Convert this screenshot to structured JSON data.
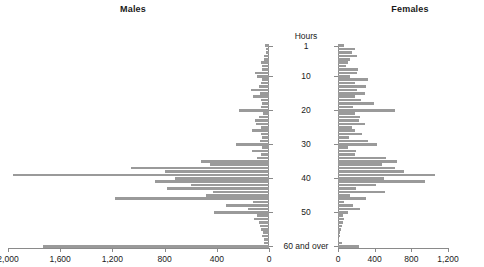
{
  "panels": {
    "males_title": "Males",
    "females_title": "Females",
    "center_heading": "Hours"
  },
  "colors": {
    "bar": "#9a9a9a",
    "axis": "#8a8a8a",
    "text": "#1a1a1a",
    "background": "#ffffff"
  },
  "chart_data": {
    "type": "bar",
    "orientation": "horizontal",
    "layout": "population-pyramid",
    "title": "",
    "subtitle": "",
    "xlabel": "",
    "ylabel": "Hours",
    "grid": false,
    "legend_position": "none",
    "categories": [
      "1",
      "2",
      "3",
      "4",
      "5",
      "6",
      "7",
      "8",
      "9",
      "10",
      "11",
      "12",
      "13",
      "14",
      "15",
      "16",
      "17",
      "18",
      "19",
      "20",
      "21",
      "22",
      "23",
      "24",
      "25",
      "26",
      "27",
      "28",
      "29",
      "30",
      "31",
      "32",
      "33",
      "34",
      "35",
      "36",
      "37",
      "38",
      "39",
      "40",
      "41",
      "42",
      "43",
      "44",
      "45",
      "46",
      "47",
      "48",
      "49",
      "50",
      "51",
      "52",
      "53",
      "54",
      "55",
      "56",
      "57",
      "58",
      "59",
      "60 and over"
    ],
    "ytick_labels": [
      "1",
      "10",
      "20",
      "30",
      "40",
      "50",
      "60 and over"
    ],
    "ytick_categories": [
      1,
      10,
      20,
      30,
      40,
      50,
      60
    ],
    "panels": [
      {
        "name": "Males",
        "side": "left",
        "xlim": [
          0,
          2000
        ],
        "xticks": [
          0,
          400,
          800,
          1200,
          1600,
          2000
        ],
        "xtick_labels": [
          "0",
          "400",
          "800",
          "1,200",
          "1,600",
          "2,000"
        ],
        "values": [
          30,
          20,
          25,
          40,
          35,
          60,
          55,
          50,
          110,
          95,
          50,
          60,
          80,
          135,
          70,
          120,
          65,
          55,
          60,
          230,
          45,
          75,
          110,
          100,
          60,
          130,
          65,
          55,
          70,
          250,
          55,
          130,
          60,
          90,
          520,
          450,
          1060,
          800,
          1960,
          720,
          870,
          600,
          780,
          430,
          480,
          1180,
          120,
          330,
          160,
          420,
          95,
          115,
          80,
          70,
          60,
          45,
          50,
          40,
          35,
          1730
        ]
      },
      {
        "name": "Females",
        "side": "right",
        "xlim": [
          0,
          1200
        ],
        "xticks": [
          0,
          400,
          800,
          1200
        ],
        "xtick_labels": [
          "0",
          "400",
          "800",
          "1,200"
        ],
        "values": [
          70,
          180,
          150,
          210,
          130,
          110,
          90,
          220,
          210,
          130,
          330,
          190,
          300,
          210,
          290,
          180,
          250,
          390,
          160,
          620,
          180,
          240,
          230,
          290,
          150,
          180,
          260,
          120,
          330,
          430,
          110,
          200,
          180,
          520,
          640,
          480,
          620,
          720,
          1060,
          500,
          950,
          410,
          200,
          510,
          130,
          300,
          70,
          160,
          240,
          110,
          50,
          60,
          55,
          40,
          30,
          25,
          20,
          15,
          40,
          230
        ]
      }
    ]
  }
}
